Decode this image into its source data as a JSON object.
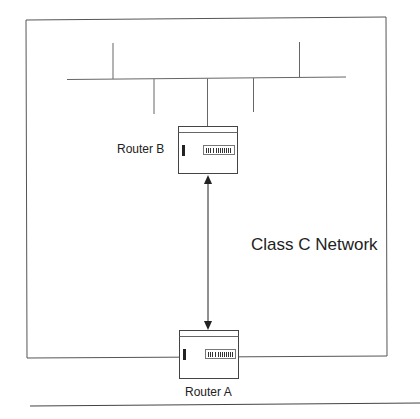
{
  "diagram": {
    "network_label": "Class C Network",
    "routers": [
      {
        "id": "router-b",
        "label": "Router B"
      },
      {
        "id": "router-a",
        "label": "Router A"
      }
    ],
    "connection": {
      "from": "Router A",
      "to": "Router B",
      "type": "bidirectional-arrow"
    },
    "colors": {
      "line": "#555555",
      "background": "#ffffff"
    }
  }
}
